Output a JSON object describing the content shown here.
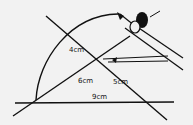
{
  "diagram": {
    "type": "geometry-construction",
    "tool": "compass",
    "labels": {
      "top_segment": "4cm",
      "left_segment": "6cm",
      "right_segment": "5cm",
      "base_segment": "9cm"
    },
    "colors": {
      "ink": "#111111",
      "background": "#f2f2f2"
    }
  }
}
